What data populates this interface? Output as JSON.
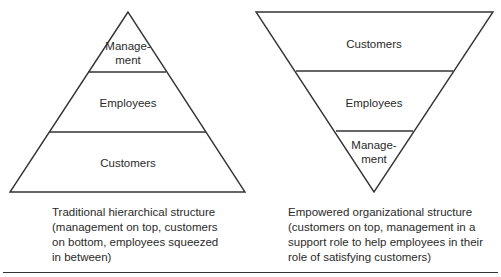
{
  "left_diagram": {
    "name": "traditional pyramid",
    "levels_top_to_bottom": [
      "Manage-\nment",
      "Employees",
      "Customers"
    ],
    "caption_lines": [
      "Traditional hierarchical structure",
      "(management on top, customers",
      "on bottom, employees squeezed",
      "in between)"
    ]
  },
  "right_diagram": {
    "name": "inverted pyramid",
    "levels_top_to_bottom": [
      "Customers",
      "Employees",
      "Manage-\nment"
    ],
    "caption_lines": [
      "Empowered organizational structure",
      "(customers on top, management in a",
      "support role to help employees in their",
      "role of satisfying customers)"
    ]
  },
  "labels": {
    "management_line1": "Manage-",
    "management_line2": "ment",
    "employees": "Employees",
    "customers": "Customers"
  }
}
